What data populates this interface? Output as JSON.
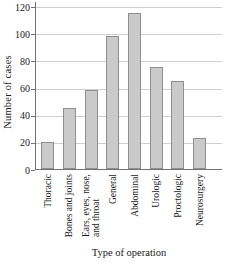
{
  "chart_data": {
    "type": "bar",
    "title": "",
    "xlabel": "Type of operation",
    "ylabel": "Number of cases",
    "categories": [
      "Thoracic",
      "Bones and joints",
      "Ears, eyes, nose,\nand throat",
      "General",
      "Abdominal",
      "Urologic",
      "Proctologic",
      "Neurosurgery"
    ],
    "values": [
      20,
      45,
      58,
      98,
      115,
      75,
      65,
      23
    ],
    "ylim": [
      0,
      120
    ],
    "yticks": [
      0,
      20,
      40,
      60,
      80,
      100,
      120
    ],
    "grid": true,
    "legend": "none",
    "bar_fill": "#cacaca",
    "bar_border": "#8f8f8f",
    "gridline_color": "#cfcfcf",
    "axis_color": "#737373",
    "text_color": "#1a1a1a",
    "background": "#ffffff"
  }
}
